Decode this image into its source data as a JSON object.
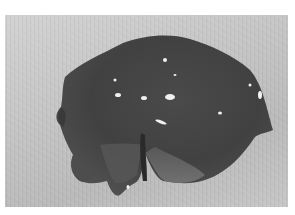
{
  "image": {
    "description": "Grayscale photograph of a gross tissue specimen on a textured light background",
    "colors": {
      "background_light": "#d2d2d2",
      "background_dark": "#b9b9b9",
      "specimen_dark": "#3c3c3c",
      "specimen_mid": "#5a5a5a",
      "specimen_light": "#7a7a7a",
      "highlight": "#f0f0f0",
      "border": "#ffffff"
    }
  }
}
